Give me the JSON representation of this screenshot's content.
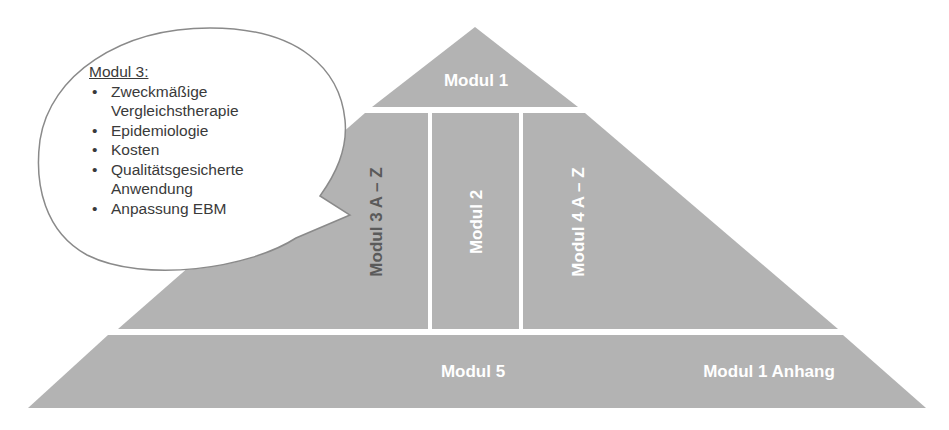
{
  "diagram": {
    "type": "pyramid",
    "colors": {
      "block_fill": "#b3b3b3",
      "separator": "#ffffff",
      "label_light": "#ffffff",
      "label_dark": "#5a5a5a",
      "bubble_fill": "#ffffff",
      "bubble_stroke": "#8a8a8a",
      "bubble_text": "#3a3a3a"
    },
    "top": {
      "label": "Modul 1"
    },
    "middle": [
      {
        "label": "Modul 3 A – Z",
        "orientation": "vertical"
      },
      {
        "label": "Modul 2",
        "orientation": "vertical"
      },
      {
        "label": "Modul 4 A – Z",
        "orientation": "vertical"
      }
    ],
    "base": [
      {
        "label": "Modul 5"
      },
      {
        "label": "Modul 1 Anhang"
      }
    ]
  },
  "callout": {
    "title": "Modul 3:",
    "items": [
      "Zweckmäßige Vergleichstherapie",
      "Epidemiologie",
      "Kosten",
      "Qualitätsgesicherte Anwendung",
      "Anpassung EBM"
    ]
  }
}
